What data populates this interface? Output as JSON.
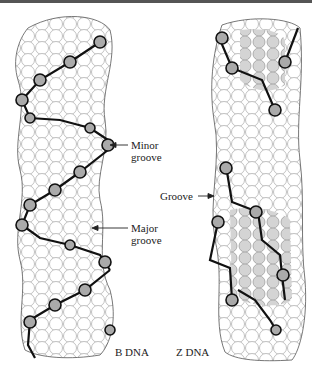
{
  "figure": {
    "panels": [
      {
        "id": "b-dna",
        "caption": "B DNA"
      },
      {
        "id": "z-dna",
        "caption": "Z DNA"
      }
    ],
    "annotations": {
      "minor_groove": [
        "Minor",
        "groove"
      ],
      "major_groove": [
        "Major",
        "groove"
      ],
      "groove": "Groove"
    },
    "colors": {
      "outline": "#333333",
      "backbone": "#111111",
      "shaded": "#cfcfcf",
      "background": "#ffffff"
    }
  }
}
